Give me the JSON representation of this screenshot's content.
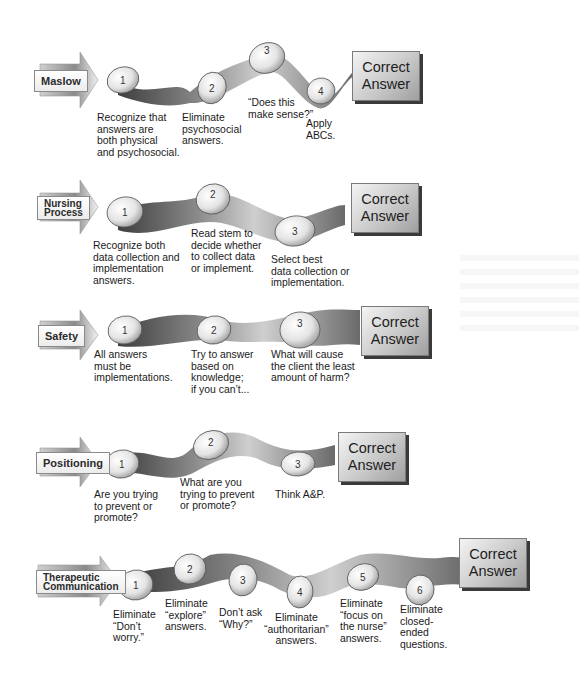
{
  "diagram": {
    "type": "flow-strategies",
    "final_label": "Correct Answer",
    "colors": {
      "ribbon_dark": "#4a4a4a",
      "ribbon_light": "#c8c8c8",
      "stone": "#e6e6e6",
      "answer_box": "#c9c9c9",
      "tag_box": "#f2f2f2"
    },
    "rows": [
      {
        "tag": "Maslow",
        "answer_line1": "Correct",
        "answer_line2": "Answer",
        "steps": [
          {
            "num": "1",
            "label": "Recognize that\nanswers are\nboth physical\nand psychosocial."
          },
          {
            "num": "2",
            "label": "Eliminate\npsychosocial\nanswers."
          },
          {
            "num": "3",
            "label": "“Does this\nmake sense?”"
          },
          {
            "num": "4",
            "label": "Apply\nABCs."
          }
        ]
      },
      {
        "tag_line1": "Nursing",
        "tag_line2": "Process",
        "answer_line1": "Correct",
        "answer_line2": "Answer",
        "steps": [
          {
            "num": "1",
            "label": "Recognize both\ndata collection and\nimplementation\nanswers."
          },
          {
            "num": "2",
            "label": "Read stem to\ndecide whether\nto collect data\nor implement."
          },
          {
            "num": "3",
            "label": "Select best\ndata collection or\nimplementation."
          }
        ]
      },
      {
        "tag": "Safety",
        "answer_line1": "Correct",
        "answer_line2": "Answer",
        "steps": [
          {
            "num": "1",
            "label": "All answers\nmust be\nimplementations."
          },
          {
            "num": "2",
            "label": "Try to answer\nbased on\nknowledge;\nif you can’t..."
          },
          {
            "num": "3",
            "label": "What will cause\nthe client the least\namount of harm?"
          }
        ]
      },
      {
        "tag": "Positioning",
        "answer_line1": "Correct",
        "answer_line2": "Answer",
        "steps": [
          {
            "num": "1",
            "label": "Are you trying\nto prevent or\npromote?"
          },
          {
            "num": "2",
            "label": "What are you\ntrying to prevent\nor promote?"
          },
          {
            "num": "3",
            "label": "Think A&P."
          }
        ]
      },
      {
        "tag_line1": "Therapeutic",
        "tag_line2": "Communication",
        "answer_line1": "Correct",
        "answer_line2": "Answer",
        "steps": [
          {
            "num": "1",
            "label": "Eliminate\n“Don’t\nworry.”"
          },
          {
            "num": "2",
            "label": "Eliminate\n“explore”\nanswers."
          },
          {
            "num": "3",
            "label": "Don’t ask\n“Why?”"
          },
          {
            "num": "4",
            "label": "Eliminate\n“authoritarian”\nanswers."
          },
          {
            "num": "5",
            "label": "Eliminate\n“focus on\nthe nurse”\nanswers."
          },
          {
            "num": "6",
            "label": "Eliminate\nclosed-\nended\nquestions."
          }
        ]
      }
    ]
  }
}
